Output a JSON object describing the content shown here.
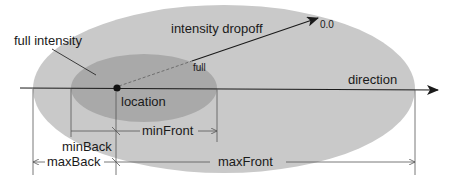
{
  "diagram": {
    "colors": {
      "background": "#ffffff",
      "outer_ellipse": "#c9c9c9",
      "inner_ellipse": "#a9a9a9",
      "lines": "#2a2a2a",
      "dim_lines": "#555555"
    },
    "labels": {
      "full_intensity": "full intensity",
      "intensity_dropoff": "intensity dropoff",
      "value_end": "0.0",
      "value_start": "full",
      "direction": "direction",
      "location": "location",
      "min_front": "minFront",
      "min_back": "minBack",
      "max_back": "maxBack",
      "max_front": "maxFront"
    }
  }
}
